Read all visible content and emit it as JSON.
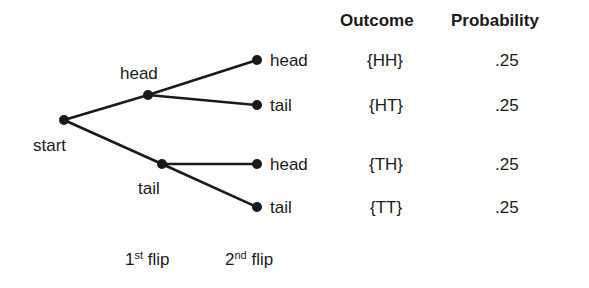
{
  "headers": {
    "outcome": "Outcome",
    "probability": "Probability"
  },
  "nodes": {
    "start": "start",
    "first_head": "head",
    "first_tail": "tail"
  },
  "leaves": [
    {
      "label": "head",
      "outcome": "{HH}",
      "probability": ".25"
    },
    {
      "label": "tail",
      "outcome": "{HT}",
      "probability": ".25"
    },
    {
      "label": "head",
      "outcome": "{TH}",
      "probability": ".25"
    },
    {
      "label": "tail",
      "outcome": "{TT}",
      "probability": ".25"
    }
  ],
  "axis_labels": {
    "first": {
      "num": "1",
      "sup": "st",
      "text": " flip"
    },
    "second": {
      "num": "2",
      "sup": "nd",
      "text": " flip"
    }
  },
  "colors": {
    "line": "#1a1a1a",
    "background": "#ffffff"
  }
}
